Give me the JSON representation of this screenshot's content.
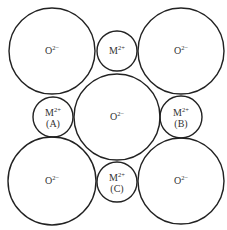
{
  "diagram": {
    "ions": [
      {
        "id": "o-top-left",
        "type": "anion",
        "symbol": "O",
        "charge": "2−",
        "tag": ""
      },
      {
        "id": "m-top",
        "type": "cation",
        "symbol": "M",
        "charge": "2+",
        "tag": ""
      },
      {
        "id": "o-top-right",
        "type": "anion",
        "symbol": "O",
        "charge": "2−",
        "tag": ""
      },
      {
        "id": "m-a",
        "type": "cation",
        "symbol": "M",
        "charge": "2+",
        "tag": "(A)"
      },
      {
        "id": "o-center",
        "type": "anion",
        "symbol": "O",
        "charge": "2−",
        "tag": ""
      },
      {
        "id": "m-b",
        "type": "cation",
        "symbol": "M",
        "charge": "2+",
        "tag": "(B)"
      },
      {
        "id": "o-bottom-left",
        "type": "anion",
        "symbol": "O",
        "charge": "2−",
        "tag": ""
      },
      {
        "id": "m-c",
        "type": "cation",
        "symbol": "M",
        "charge": "2+",
        "tag": "(C)"
      },
      {
        "id": "o-bottom-right",
        "type": "anion",
        "symbol": "O",
        "charge": "2−",
        "tag": ""
      }
    ]
  }
}
